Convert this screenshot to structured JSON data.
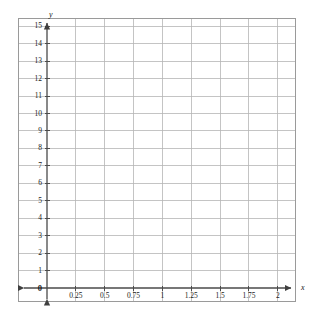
{
  "chart_data": {
    "type": "scatter",
    "title": "",
    "subtitle": "",
    "xlabel": "x",
    "ylabel": "y",
    "xlim": [
      0,
      2.25
    ],
    "ylim": [
      0,
      15.8
    ],
    "grid": true,
    "legend": false,
    "legend_position": "none",
    "series": [],
    "x": [],
    "values": [],
    "annotations": [],
    "origin_label": "0",
    "x_ticks": [
      {
        "value": 0.25,
        "label": "0.25"
      },
      {
        "value": 0.5,
        "label": "0.5"
      },
      {
        "value": 0.75,
        "label": "0.75"
      },
      {
        "value": 1,
        "label": "1"
      },
      {
        "value": 1.25,
        "label": "1.25"
      },
      {
        "value": 1.5,
        "label": "1.5"
      },
      {
        "value": 1.75,
        "label": "1.75"
      },
      {
        "value": 2,
        "label": "2"
      }
    ],
    "y_ticks": [
      {
        "value": 1,
        "label": "1"
      },
      {
        "value": 2,
        "label": "2"
      },
      {
        "value": 3,
        "label": "3"
      },
      {
        "value": 4,
        "label": "4"
      },
      {
        "value": 5,
        "label": "5"
      },
      {
        "value": 6,
        "label": "6"
      },
      {
        "value": 7,
        "label": "7"
      },
      {
        "value": 8,
        "label": "8"
      },
      {
        "value": 9,
        "label": "9"
      },
      {
        "value": 10,
        "label": "10"
      },
      {
        "value": 11,
        "label": "11"
      },
      {
        "value": 12,
        "label": "12"
      },
      {
        "value": 13,
        "label": "13"
      },
      {
        "value": 14,
        "label": "14"
      },
      {
        "value": 15,
        "label": "15"
      }
    ],
    "x_gridlines": [
      0.25,
      0.5,
      0.75,
      1,
      1.25,
      1.5,
      1.75,
      2
    ],
    "y_gridlines": [
      1,
      2,
      3,
      4,
      5,
      6,
      7,
      8,
      9,
      10,
      11,
      12,
      13,
      14,
      15
    ],
    "colors": {
      "grid": "#b5b5b5",
      "axis": "#4d4d4d",
      "frame": "#9a9a9a",
      "background": "#ffffff",
      "text": "#1a1a1a"
    }
  }
}
